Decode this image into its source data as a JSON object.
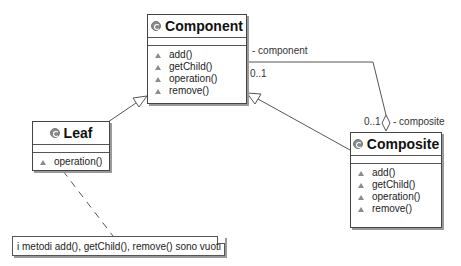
{
  "diagram": {
    "type": "UML class diagram",
    "classes": {
      "component": {
        "name": "Component",
        "operations": [
          "add()",
          "getChild()",
          "operation()",
          "remove()"
        ]
      },
      "leaf": {
        "name": "Leaf",
        "operations": [
          "operation()"
        ]
      },
      "composite": {
        "name": "Composite",
        "operations": [
          "add()",
          "getChild()",
          "operation()",
          "remove()"
        ]
      }
    },
    "associations": [
      {
        "from": "Composite",
        "to": "Component",
        "kind": "aggregation",
        "role_at_component": "- component",
        "mult_at_component": "0..1",
        "role_at_composite": "- composite",
        "mult_at_composite": "0..1"
      }
    ],
    "generalizations": [
      {
        "child": "Leaf",
        "parent": "Component"
      },
      {
        "child": "Composite",
        "parent": "Component"
      }
    ],
    "note": {
      "text": "i metodi add(), getChild(), remove() sono vuoti",
      "attached_to": "Leaf"
    },
    "colors": {
      "line": "#555555",
      "border": "#444444",
      "shadow": "#9a9a9a",
      "visibility_icon": "#8c8c8c"
    }
  }
}
